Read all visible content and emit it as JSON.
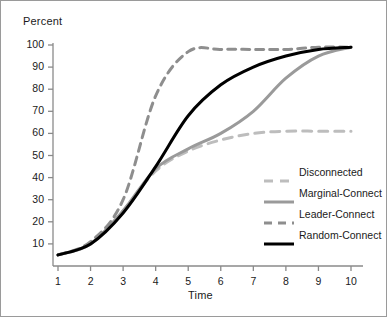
{
  "chart_data": {
    "type": "line",
    "title": "",
    "xlabel": "Time",
    "ylabel": "Percent",
    "xlim": [
      0.6,
      10.4
    ],
    "ylim": [
      0,
      104
    ],
    "grid": false,
    "legend_position": "right-middle",
    "x": [
      1,
      2,
      3,
      4,
      5,
      6,
      7,
      8,
      9,
      10
    ],
    "xticks": [
      "1",
      "2",
      "3",
      "4",
      "5",
      "6",
      "7",
      "8",
      "9",
      "10"
    ],
    "yticks": [
      "10",
      "20",
      "30",
      "40",
      "50",
      "60",
      "70",
      "80",
      "90",
      "100"
    ],
    "series": [
      {
        "name": "Disconnected",
        "color": "#bdbdbd",
        "dash": "9,7",
        "width": 3.0,
        "values": [
          5,
          10,
          25,
          43,
          52,
          57,
          60,
          61,
          61,
          61
        ]
      },
      {
        "name": "Marginal-Connect",
        "color": "#9a9a9a",
        "dash": "none",
        "width": 3.0,
        "values": [
          5,
          10,
          25,
          44,
          53,
          60,
          70,
          85,
          95,
          99
        ]
      },
      {
        "name": "Leader-Connect",
        "color": "#8e8e8e",
        "dash": "8,6",
        "width": 3.0,
        "values": [
          5,
          11,
          30,
          77,
          97,
          98,
          98,
          98,
          99,
          99
        ]
      },
      {
        "name": "Random-Connect",
        "color": "#000000",
        "dash": "none",
        "width": 3.0,
        "values": [
          5,
          10,
          24,
          45,
          68,
          82,
          90,
          95,
          98,
          99
        ]
      }
    ]
  },
  "axes": {
    "y_title": "Percent",
    "x_title": "Time"
  },
  "legend": {
    "items": [
      {
        "label": "Disconnected"
      },
      {
        "label": "Marginal-Connect"
      },
      {
        "label": "Leader-Connect"
      },
      {
        "label": "Random-Connect"
      }
    ]
  }
}
